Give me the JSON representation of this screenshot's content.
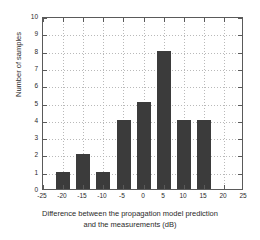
{
  "chart_data": {
    "type": "bar",
    "title": "",
    "xlabel": "Difference between the propagation model prediction and the measurements (dB)",
    "xlabel_line1": "Difference between the propagation model prediction",
    "xlabel_line2": "and the measurements (dB)",
    "ylabel": "Number of samples",
    "xlim": [
      -25,
      25
    ],
    "ylim": [
      0,
      10
    ],
    "xticks": [
      -25,
      -20,
      -15,
      -10,
      -5,
      0,
      5,
      10,
      15,
      20,
      25
    ],
    "xticklabels": [
      "-25",
      "-20",
      "-15",
      "-10",
      "-5",
      "0",
      "5",
      "10",
      "15",
      "20",
      "25"
    ],
    "yticks": [
      0,
      1,
      2,
      3,
      4,
      5,
      6,
      7,
      8,
      9,
      10
    ],
    "yticklabels": [
      "0",
      "1",
      "2",
      "3",
      "4",
      "5",
      "6",
      "7",
      "8",
      "9",
      "10"
    ],
    "grid": true,
    "legend": null,
    "categories": [
      -20,
      -15,
      -10,
      -5,
      0,
      5,
      10,
      15
    ],
    "values": [
      1,
      2,
      1,
      4,
      5,
      8,
      4,
      4
    ],
    "bar_color": "#3b3b3b",
    "bar_width_db": 3.4,
    "axis_color": "#5a5a5a",
    "grid_color": "#b9b9b9",
    "background_color": "#ffffff"
  }
}
